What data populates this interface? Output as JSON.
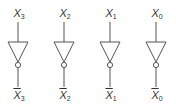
{
  "diagram": {
    "title": "",
    "gates": [
      {
        "type": "NOT",
        "input": {
          "base": "X",
          "sub": "3"
        },
        "output": {
          "base": "X",
          "sub": "3",
          "inverted": true
        },
        "cx": 18
      },
      {
        "type": "NOT",
        "input": {
          "base": "X",
          "sub": "2"
        },
        "output": {
          "base": "X",
          "sub": "2",
          "inverted": true
        },
        "cx": 64
      },
      {
        "type": "NOT",
        "input": {
          "base": "X",
          "sub": "1"
        },
        "output": {
          "base": "X",
          "sub": "1",
          "inverted": true
        },
        "cx": 110
      },
      {
        "type": "NOT",
        "input": {
          "base": "X",
          "sub": "0"
        },
        "output": {
          "base": "X",
          "sub": "0",
          "inverted": true
        },
        "cx": 156
      }
    ],
    "colors": {
      "stroke": "#555555",
      "text": "#333333"
    }
  }
}
